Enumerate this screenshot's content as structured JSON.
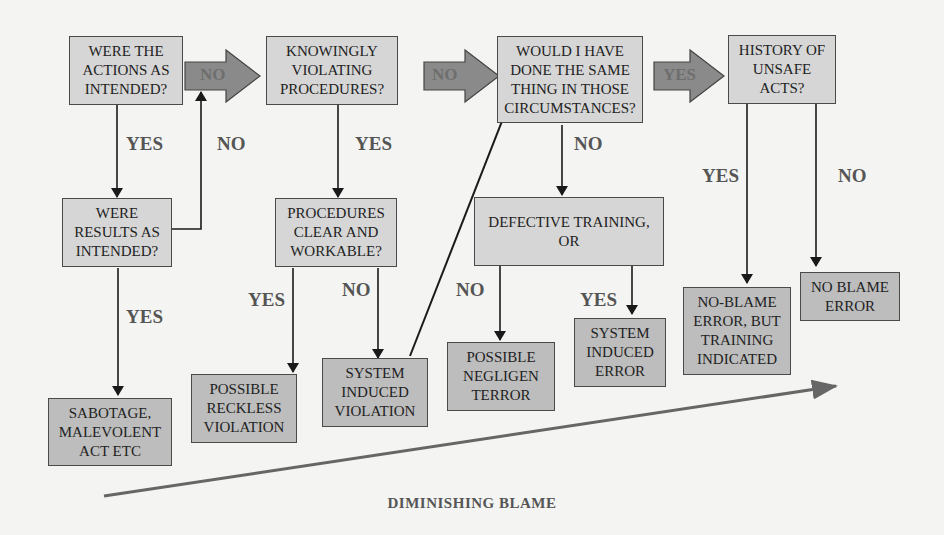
{
  "diagram": {
    "type": "decision-flowchart",
    "title": "",
    "footer_label": "DIMINISHING BLAME",
    "colors": {
      "question_fill": "#d6d6d6",
      "outcome_fill": "#bdbdbd",
      "big_arrow_fill": "#8a8a8a",
      "line": "#1a1a1a",
      "blame_arrow": "#666666"
    },
    "questions": [
      {
        "id": "q1",
        "text": "WERE THE ACTIONS AS INTENDED?"
      },
      {
        "id": "q2",
        "text": "KNOWINGLY VIOLATING PROCEDURES?"
      },
      {
        "id": "q3",
        "text": "WOULD I HAVE DONE THE SAME THING IN THOSE CIRCUMSTANCES?"
      },
      {
        "id": "q4",
        "text": "HISTORY OF UNSAFE ACTS?"
      },
      {
        "id": "q5",
        "text": "WERE RESULTS AS INTENDED?"
      },
      {
        "id": "q6",
        "text": "PROCEDURES CLEAR AND WORKABLE?"
      },
      {
        "id": "q7",
        "text": "DEFECTIVE TRAINING, OR"
      }
    ],
    "outcomes": [
      {
        "id": "o1",
        "text": "SABOTAGE, MALEVOLENT ACT ETC"
      },
      {
        "id": "o2",
        "text": "POSSIBLE RECKLESS VIOLATION"
      },
      {
        "id": "o3",
        "text": "SYSTEM INDUCED VIOLATION"
      },
      {
        "id": "o4",
        "text": "POSSIBLE NEGLIGEN TERROR"
      },
      {
        "id": "o5",
        "text": "SYSTEM INDUCED ERROR"
      },
      {
        "id": "o6",
        "text": "NO-BLAME ERROR, BUT TRAINING INDICATED"
      },
      {
        "id": "o7",
        "text": "NO BLAME ERROR"
      }
    ],
    "big_arrows": [
      {
        "from": "q1",
        "to": "q2",
        "label": "NO"
      },
      {
        "from": "q2",
        "to": "q3",
        "label": "NO"
      },
      {
        "from": "q3",
        "to": "q4",
        "label": "YES"
      }
    ],
    "edges": [
      {
        "from": "q1",
        "to": "q5",
        "label": "YES"
      },
      {
        "from": "q5",
        "to": "q1-q2 arrow",
        "label": "NO"
      },
      {
        "from": "q5",
        "to": "o1",
        "label": "YES"
      },
      {
        "from": "q2",
        "to": "q6",
        "label": "YES"
      },
      {
        "from": "q6",
        "to": "o2",
        "label": "YES"
      },
      {
        "from": "q6",
        "to": "o3",
        "label": "NO"
      },
      {
        "from": "o3",
        "to": "q3",
        "label": ""
      },
      {
        "from": "q3",
        "to": "q7",
        "label": "NO"
      },
      {
        "from": "q7",
        "to": "o4",
        "label": "NO"
      },
      {
        "from": "q7",
        "to": "o5",
        "label": "YES"
      },
      {
        "from": "q4",
        "to": "o6",
        "label": "YES"
      },
      {
        "from": "q4",
        "to": "o7",
        "label": "NO"
      }
    ]
  },
  "labels": {
    "yes": "YES",
    "no": "NO"
  }
}
